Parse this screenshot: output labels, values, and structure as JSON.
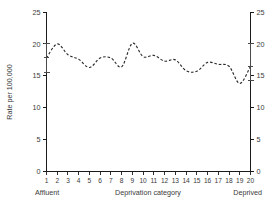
{
  "chart_data": {
    "type": "line",
    "title": "",
    "subtitle": "",
    "xlabel": "Deprivation category",
    "ylabel": "Rate per 100,000",
    "xlim": [
      1,
      20
    ],
    "ylim": [
      0,
      25
    ],
    "grid": false,
    "legend": false,
    "legend_position": "none",
    "line_style": "dashed",
    "x_left_annotation": "Affluent",
    "x_right_annotation": "Deprived",
    "y_ticks": [
      0,
      5,
      10,
      15,
      20,
      25
    ],
    "y_tick_labels": [
      "0",
      "5",
      "10",
      "15",
      "20",
      "25"
    ],
    "y_axis_duplicated_right": true,
    "x_ticks": [
      1,
      2,
      3,
      4,
      5,
      6,
      7,
      8,
      9,
      10,
      11,
      12,
      13,
      14,
      15,
      16,
      17,
      18,
      19,
      20
    ],
    "x_tick_labels": [
      "1",
      "2",
      "3",
      "4",
      "5",
      "6",
      "7",
      "8",
      "9",
      "10",
      "11",
      "12",
      "13",
      "14",
      "15",
      "16",
      "17",
      "18",
      "19",
      "20"
    ],
    "categories": [
      1,
      2,
      3,
      4,
      5,
      6,
      7,
      8,
      9,
      10,
      11,
      12,
      13,
      14,
      15,
      16,
      17,
      18,
      19,
      20
    ],
    "values": [
      17.8,
      20.0,
      18.3,
      17.6,
      16.3,
      17.8,
      17.8,
      16.4,
      20.1,
      18.0,
      18.2,
      17.3,
      17.5,
      15.8,
      15.7,
      17.1,
      16.8,
      16.5,
      13.8,
      16.5
    ],
    "series": [
      {
        "name": "Rate",
        "values": [
          17.8,
          20.0,
          18.3,
          17.6,
          16.3,
          17.8,
          17.8,
          16.4,
          20.1,
          18.0,
          18.2,
          17.3,
          17.5,
          15.8,
          15.7,
          17.1,
          16.8,
          16.5,
          13.8,
          16.5
        ]
      }
    ],
    "error_bars": [
      {
        "category": 1,
        "value": 17.8,
        "lower": 15.5,
        "upper": 20.1
      },
      {
        "category": 20,
        "value": 16.5,
        "lower": 14.2,
        "upper": 20.1
      }
    ],
    "colors": {
      "line": "#2b2b2b",
      "axis": "#1a1a1a",
      "text": "#3a3a3a",
      "errorbar": "#4a4a4a",
      "background": "#ffffff"
    }
  }
}
